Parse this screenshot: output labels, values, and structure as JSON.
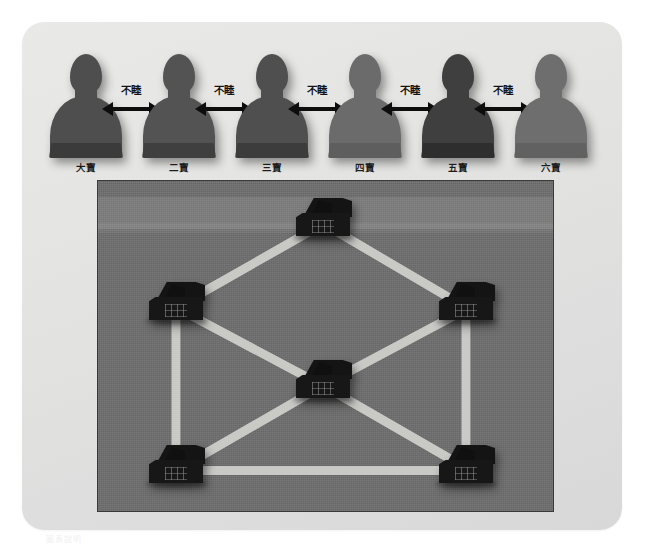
{
  "diagram": {
    "title_caption": "圖表說明",
    "people_row": {
      "people": [
        {
          "id": "p1",
          "label": "大寶",
          "tone": "#4e4e4e",
          "textured": true
        },
        {
          "id": "p2",
          "label": "二寶",
          "tone": "#535353",
          "textured": true
        },
        {
          "id": "p3",
          "label": "三寶",
          "tone": "#4f4f4f",
          "textured": true
        },
        {
          "id": "p4",
          "label": "四寶",
          "tone": "#6b6b6b",
          "textured": false
        },
        {
          "id": "p5",
          "label": "五寶",
          "tone": "#3f3f3f",
          "textured": true
        },
        {
          "id": "p6",
          "label": "六寶",
          "tone": "#6e6e6e",
          "textured": false
        }
      ],
      "relations": [
        {
          "from": "大寶",
          "to": "二寶",
          "label": "不睦",
          "arrow": "double-headed"
        },
        {
          "from": "二寶",
          "to": "三寶",
          "label": "不睦",
          "arrow": "double-headed"
        },
        {
          "from": "三寶",
          "to": "四寶",
          "label": "不睦",
          "arrow": "double-headed"
        },
        {
          "from": "四寶",
          "to": "五寶",
          "label": "不睦",
          "arrow": "double-headed"
        },
        {
          "from": "五寶",
          "to": "六寶",
          "label": "不睦",
          "arrow": "double-headed"
        }
      ]
    },
    "graph_panel": {
      "node_icon": "house-icon",
      "edge_color": "#c9c9c6",
      "background_color": "#6f6f6f",
      "nodes": [
        {
          "id": "n-top",
          "label": "",
          "x": 225,
          "y": 38
        },
        {
          "id": "n-left-upper",
          "label": "",
          "x": 78,
          "y": 122
        },
        {
          "id": "n-right-upper",
          "label": "",
          "x": 368,
          "y": 122
        },
        {
          "id": "n-center",
          "label": "",
          "x": 225,
          "y": 200
        },
        {
          "id": "n-left-lower",
          "label": "",
          "x": 78,
          "y": 285
        },
        {
          "id": "n-right-lower",
          "label": "",
          "x": 368,
          "y": 285
        }
      ],
      "edges": [
        {
          "from": "n-top",
          "to": "n-left-upper"
        },
        {
          "from": "n-top",
          "to": "n-right-upper"
        },
        {
          "from": "n-left-upper",
          "to": "n-center"
        },
        {
          "from": "n-right-upper",
          "to": "n-center"
        },
        {
          "from": "n-left-upper",
          "to": "n-left-lower"
        },
        {
          "from": "n-right-upper",
          "to": "n-right-lower"
        },
        {
          "from": "n-center",
          "to": "n-left-lower"
        },
        {
          "from": "n-center",
          "to": "n-right-lower"
        },
        {
          "from": "n-left-lower",
          "to": "n-right-lower"
        }
      ]
    }
  },
  "colors": {
    "card_background": "#e4e4e2",
    "panel_background": "#6f6f6f",
    "road": "#c9c9c6",
    "house": "#141414",
    "arrow": "#0d0d0d",
    "text": "#1b1b1b"
  }
}
